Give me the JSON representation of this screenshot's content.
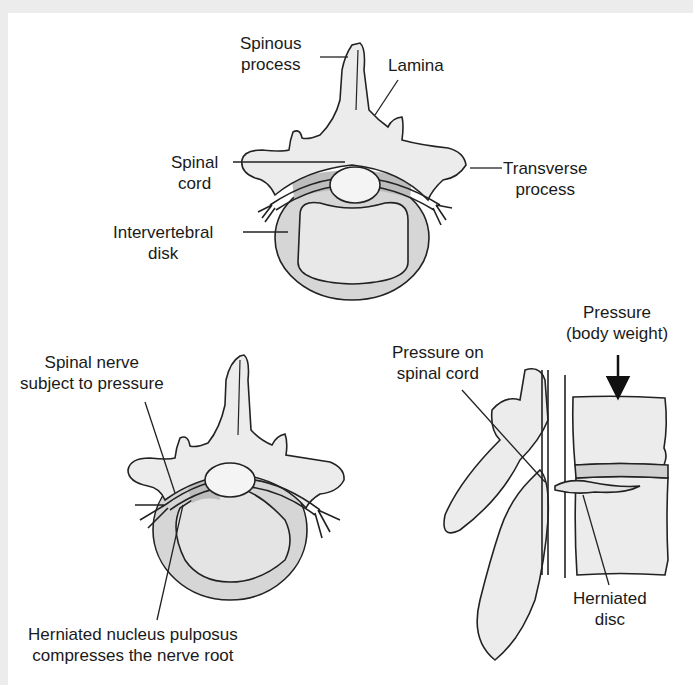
{
  "colors": {
    "bone_fill": "#ececec",
    "disk_outer": "#d4d4d4",
    "disk_inner": "#e8e8e8",
    "disk_dark": "#bdbdbd",
    "stroke": "#222222",
    "frame": "#ececec",
    "background": "#ffffff"
  },
  "top_view": {
    "labels": {
      "spinous_process": [
        "Spinous",
        "process"
      ],
      "lamina": [
        "Lamina"
      ],
      "transverse_process": [
        "Transverse",
        "process"
      ],
      "spinal_cord": [
        "Spinal",
        "cord"
      ],
      "intervertebral_disk": [
        "Intervertebral",
        "disk"
      ]
    }
  },
  "herniated_view": {
    "labels": {
      "spinal_nerve": [
        "Spinal nerve",
        "subject to pressure"
      ],
      "herniated_nucleus": [
        "Herniated nucleus pulposus",
        "compresses the nerve root"
      ]
    }
  },
  "lateral_view": {
    "labels": {
      "pressure_body_weight": [
        "Pressure",
        "(body weight)"
      ],
      "pressure_on_spinal_cord": [
        "Pressure on",
        "spinal cord"
      ],
      "herniated_disc": [
        "Herniated",
        "disc"
      ]
    },
    "arrow": "down-arrow"
  }
}
